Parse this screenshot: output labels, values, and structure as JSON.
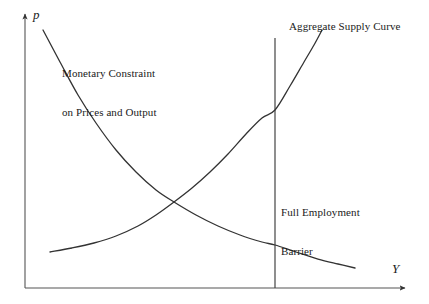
{
  "figure": {
    "background_color": "#ffffff",
    "line_color": "#333333",
    "text_color": "#1a1a1a"
  },
  "axes": {
    "y_label": "p",
    "x_label": "Y",
    "origin": {
      "x": 25,
      "y": 288
    },
    "y_top": 10,
    "x_right": 410
  },
  "labels": {
    "monetary_constraint": "Monetary Constraint\non Prices and Output",
    "monetary_constraint_line1": "Monetary Constraint",
    "monetary_constraint_line2": "on Prices and Output",
    "aggregate_supply": "Aggregate Supply Curve",
    "full_employment_line1": "Full Employment",
    "full_employment_line2": "Barrier"
  },
  "chart_data": {
    "type": "line",
    "title": "",
    "xlabel": "Y",
    "ylabel": "p",
    "grid": false,
    "legend": "inline-annotations",
    "xlim": [
      25,
      410
    ],
    "ylim": [
      288,
      10
    ],
    "series": [
      {
        "name": "Monetary Constraint on Prices and Output",
        "shape": "convex-decreasing",
        "points": [
          [
            43,
            30
          ],
          [
            60,
            62
          ],
          [
            78,
            95
          ],
          [
            96,
            123
          ],
          [
            116,
            150
          ],
          [
            136,
            172
          ],
          [
            156,
            190
          ],
          [
            174,
            202
          ],
          [
            196,
            215
          ],
          [
            218,
            226
          ],
          [
            240,
            235
          ],
          [
            262,
            242
          ],
          [
            275,
            245
          ],
          [
            296,
            252
          ],
          [
            318,
            259
          ],
          [
            338,
            264
          ],
          [
            355,
            268
          ]
        ]
      },
      {
        "name": "Aggregate Supply Curve",
        "shape": "convex-increasing",
        "points": [
          [
            50,
            252
          ],
          [
            72,
            248
          ],
          [
            94,
            243
          ],
          [
            116,
            236
          ],
          [
            138,
            226
          ],
          [
            156,
            215
          ],
          [
            174,
            202
          ],
          [
            192,
            188
          ],
          [
            210,
            172
          ],
          [
            228,
            154
          ],
          [
            246,
            134
          ],
          [
            262,
            118
          ],
          [
            275,
            110
          ],
          [
            290,
            86
          ],
          [
            304,
            62
          ],
          [
            314,
            45
          ],
          [
            322,
            30
          ]
        ]
      },
      {
        "name": "Full Employment Barrier",
        "shape": "vertical",
        "points": [
          [
            275,
            38
          ],
          [
            275,
            288
          ]
        ]
      }
    ],
    "annotations": [
      {
        "text": "Monetary Constraint on Prices and Output",
        "x": 62,
        "y": 41
      },
      {
        "text": "Aggregate Supply Curve",
        "x": 289,
        "y": 20
      },
      {
        "text": "Full Employment Barrier",
        "x": 281,
        "y": 180
      }
    ],
    "intersections": [
      {
        "name": "equilibrium",
        "x": 174,
        "y": 202
      },
      {
        "name": "supply-meets-barrier",
        "x": 275,
        "y": 110
      },
      {
        "name": "constraint-meets-barrier",
        "x": 275,
        "y": 243
      }
    ]
  }
}
